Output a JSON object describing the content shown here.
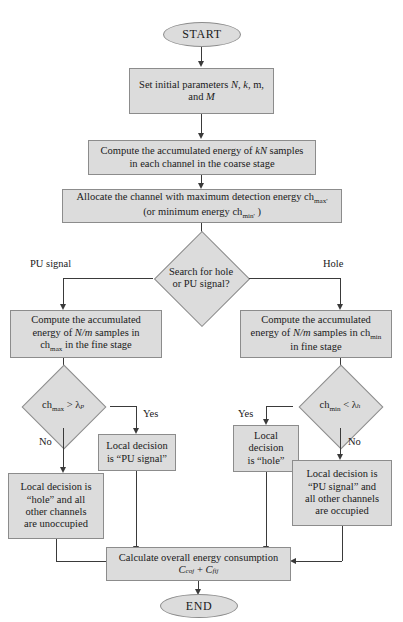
{
  "diagram": {
    "colors": {
      "node_fill": "#dcdcdc",
      "node_border": "#8c8c8c",
      "connector": "#3a3a3a",
      "background": "#ffffff",
      "text": "#1a1a1a"
    },
    "nodes": {
      "start": {
        "label": "START",
        "shape": "terminator"
      },
      "set_params": {
        "shape": "process",
        "line1_pre": "Set initial parameters ",
        "line1_n": "N",
        "line1_mid1": ", ",
        "line1_k": "k",
        "line1_mid2": ", m,",
        "line2_pre": "and ",
        "line2_m": "M"
      },
      "compute_coarse": {
        "shape": "process",
        "line1_pre": "Compute the accumulated energy of ",
        "line1_kn": "kN",
        "line1_post": " samples",
        "line2": "in each channel in the coarse stage"
      },
      "allocate": {
        "shape": "process",
        "line1_pre": "Allocate the channel with maximum detection energy ch",
        "line1_sub": "max'",
        "line2_pre": "(or minimum energy ch",
        "line2_sub": "min'",
        "line2_post": " )"
      },
      "search_decision": {
        "shape": "decision",
        "line1": "Search for hole",
        "line2": "or PU signal?"
      },
      "compute_fine_left": {
        "shape": "process",
        "line1": "Compute the accumulated",
        "line2_pre": "energy of ",
        "line2_nm": "N/m",
        "line2_post": " samples in",
        "line3_pre": "ch",
        "line3_sub": "max",
        "line3_post": "  in the fine stage"
      },
      "compute_fine_right": {
        "shape": "process",
        "line1": "Compute the accumulated",
        "line2_pre": "energy of ",
        "line2_nm": "N/m",
        "line2_post": " samples in ch",
        "line2_sub": "min",
        "line3": "in fine stage"
      },
      "decision_left": {
        "shape": "decision",
        "pre": "ch",
        "sub": "max",
        "op": " > ",
        "lambda": "λ",
        "lambda_sub": "p"
      },
      "decision_right": {
        "shape": "decision",
        "pre": "ch",
        "sub": "min",
        "op": " < ",
        "lambda": "λ",
        "lambda_sub": "h"
      },
      "local_pu_signal": {
        "shape": "process",
        "line1": "Local decision",
        "line2": "is “PU signal”"
      },
      "local_hole": {
        "shape": "process",
        "line1": "Local",
        "line2": "decision",
        "line3": "is “hole”"
      },
      "local_hole_all": {
        "shape": "process",
        "line1": "Local decision is",
        "line2": "“hole” and all",
        "line3": "other channels",
        "line4": "are unoccupied"
      },
      "local_pu_all": {
        "shape": "process",
        "line1": "Local decision is",
        "line2": "“PU signal” and",
        "line3": "all other channels",
        "line4": "are occupied"
      },
      "calculate_energy": {
        "shape": "process",
        "line1": "Calculate overall energy consumption",
        "formula_c1": "C",
        "formula_c1_sub": "coj",
        "formula_op": " + ",
        "formula_c2": "C",
        "formula_c2_sub": "fij"
      },
      "end": {
        "label": "END",
        "shape": "terminator"
      }
    },
    "edge_labels": {
      "pu_signal": "PU signal",
      "hole": "Hole",
      "yes_left": "Yes",
      "no_left": "No",
      "yes_right": "Yes",
      "no_right": "No"
    }
  }
}
